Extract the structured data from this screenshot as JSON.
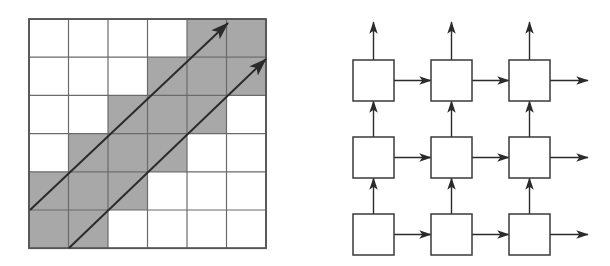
{
  "figure": {
    "width": 610,
    "height": 266,
    "background": "#ffffff",
    "panels": [
      {
        "name": "dtw-cost-matrix",
        "label": "grid-diagram"
      },
      {
        "name": "recurrent-network",
        "label": "network-diagram"
      }
    ]
  },
  "colors": {
    "shaded_cell": "#a8a8a8",
    "empty_cell": "#ffffff",
    "grid_line": "#6b6b6b",
    "grid_border": "#555555",
    "arrow_stroke": "#2b2b2b",
    "box_stroke": "#3a3a3a",
    "box_fill": "#ffffff"
  },
  "grid_diagram": {
    "name": "shaded-grid",
    "origin_x": 29,
    "origin_y": 19,
    "cols": 6,
    "rows": 6,
    "cell_width": 39.5,
    "cell_height": 38.2,
    "shaded_cells": [
      [
        0,
        0,
        0,
        0,
        1,
        1
      ],
      [
        0,
        0,
        0,
        1,
        1,
        1
      ],
      [
        0,
        0,
        1,
        1,
        1,
        0
      ],
      [
        0,
        1,
        1,
        1,
        0,
        0
      ],
      [
        1,
        1,
        1,
        0,
        0,
        0
      ],
      [
        1,
        1,
        0,
        0,
        0,
        0
      ]
    ],
    "arrows": [
      {
        "name": "diagonal-arrow-upper",
        "x1": 30,
        "y1": 210,
        "x2": 228,
        "y2": 23
      },
      {
        "name": "diagonal-arrow-lower",
        "x1": 69,
        "y1": 248,
        "x2": 266,
        "y2": 59
      }
    ]
  },
  "network_diagram": {
    "name": "box-arrow-grid",
    "cols": 3,
    "rows": 3,
    "box_size": 41,
    "col_x": [
      353,
      431,
      509
    ],
    "row_y": [
      60,
      137,
      214
    ],
    "horizontal_arrows": {
      "name": "rightward-arrow",
      "count_per_row": 3,
      "exit_length": 38
    },
    "vertical_arrows": {
      "name": "upward-arrow",
      "count_per_col": 3,
      "exit_length": 38
    },
    "nodes": [
      {
        "name": "node-r0-c0",
        "label": ""
      },
      {
        "name": "node-r0-c1",
        "label": ""
      },
      {
        "name": "node-r0-c2",
        "label": ""
      },
      {
        "name": "node-r1-c0",
        "label": ""
      },
      {
        "name": "node-r1-c1",
        "label": ""
      },
      {
        "name": "node-r1-c2",
        "label": ""
      },
      {
        "name": "node-r2-c0",
        "label": ""
      },
      {
        "name": "node-r2-c1",
        "label": ""
      },
      {
        "name": "node-r2-c2",
        "label": ""
      }
    ]
  }
}
